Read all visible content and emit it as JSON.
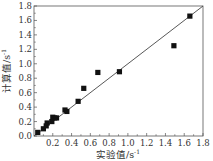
{
  "chart_data": {
    "type": "scatter",
    "title": "",
    "xlabel": "实验值/s⁻¹",
    "ylabel": "计算值/s⁻¹",
    "xlim": [
      0,
      1.8
    ],
    "ylim": [
      0,
      1.8
    ],
    "xticks": [
      "0.2",
      "0.4",
      "0.6",
      "0.8",
      "1.0",
      "1.2",
      "1.4",
      "1.6",
      "1.8"
    ],
    "yticks": [
      "0.0",
      "0.2",
      "0.4",
      "0.6",
      "0.8",
      "1.0",
      "1.2",
      "1.4",
      "1.6",
      "1.8"
    ],
    "grid": false,
    "legend": null,
    "reference_line": {
      "type": "y=x",
      "from": [
        0,
        0
      ],
      "to": [
        1.8,
        1.8
      ]
    },
    "series": [
      {
        "name": "data",
        "marker": "square",
        "color": "#111111",
        "points": [
          [
            0.04,
            0.05
          ],
          [
            0.1,
            0.1
          ],
          [
            0.13,
            0.14
          ],
          [
            0.14,
            0.18
          ],
          [
            0.19,
            0.2
          ],
          [
            0.2,
            0.26
          ],
          [
            0.22,
            0.25
          ],
          [
            0.24,
            0.25
          ],
          [
            0.33,
            0.36
          ],
          [
            0.35,
            0.34
          ],
          [
            0.47,
            0.48
          ],
          [
            0.53,
            0.66
          ],
          [
            0.68,
            0.88
          ],
          [
            0.91,
            0.89
          ],
          [
            1.49,
            1.25
          ],
          [
            1.66,
            1.66
          ]
        ]
      }
    ]
  },
  "axes": {
    "xlabel_main": "实验值/s",
    "xlabel_sup": "-1",
    "ylabel_main": "计算值/s",
    "ylabel_sup": "-1",
    "y_zero": "0.0"
  }
}
